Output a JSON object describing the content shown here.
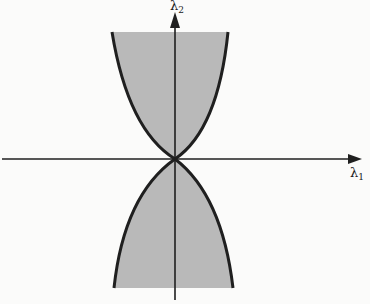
{
  "diagram": {
    "type": "region-plot",
    "axes": {
      "x": {
        "symbol": "λ",
        "subscript": "1"
      },
      "y": {
        "symbol": "λ",
        "subscript": "2"
      }
    },
    "colors": {
      "background": "#fbfbfa",
      "shade": "#b9b9b9",
      "stroke": "#1f1f1f"
    },
    "geometry": {
      "origin": [
        175,
        159
      ],
      "upper_region": {
        "top_y": 32,
        "left_x": 112,
        "right_x": 228
      },
      "lower_region": {
        "bottom_y": 288,
        "left_x": 114,
        "right_x": 233
      }
    }
  }
}
